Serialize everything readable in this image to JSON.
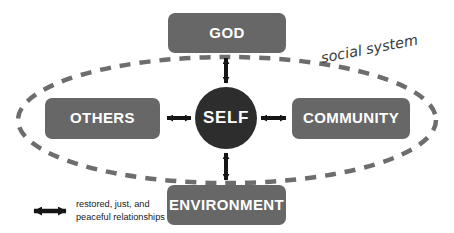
{
  "diagram": {
    "title_label": "social system",
    "center": {
      "id": "self",
      "label": "SELF",
      "shape": "circle",
      "fill": "#2d2d2d",
      "cx": 226,
      "cy": 118,
      "r": 31
    },
    "nodes": [
      {
        "id": "god",
        "label": "GOD",
        "shape": "rounded-rect",
        "fill": "#676767",
        "x": 168,
        "y": 13,
        "width": 118,
        "height": 40,
        "radius": 7
      },
      {
        "id": "others",
        "label": "OTHERS",
        "shape": "rounded-rect",
        "fill": "#676767",
        "x": 45,
        "y": 98,
        "width": 115,
        "height": 41,
        "radius": 7
      },
      {
        "id": "community",
        "label": "COMMUNITY",
        "shape": "rounded-rect",
        "fill": "#676767",
        "x": 292,
        "y": 98,
        "width": 118,
        "height": 41,
        "radius": 7
      },
      {
        "id": "environment",
        "label": "ENVIRONMENT",
        "shape": "rounded-rect",
        "fill": "#676767",
        "x": 167,
        "y": 185,
        "width": 119,
        "height": 40,
        "radius": 7
      }
    ],
    "connectors": [
      {
        "id": "self-god",
        "from": "self",
        "to": "god",
        "style": "double-arrow",
        "orientation": "vertical"
      },
      {
        "id": "self-others",
        "from": "self",
        "to": "others",
        "style": "double-arrow",
        "orientation": "horizontal"
      },
      {
        "id": "self-community",
        "from": "self",
        "to": "community",
        "style": "double-arrow",
        "orientation": "horizontal"
      },
      {
        "id": "self-environment",
        "from": "self",
        "to": "environment",
        "style": "double-arrow",
        "orientation": "vertical"
      }
    ],
    "boundary": {
      "id": "social-system-ellipse",
      "shape": "dashed-ellipse",
      "stroke": "#6d6d6d",
      "cx": 227,
      "cy": 120,
      "rx": 209,
      "ry": 63,
      "dash": "11 9",
      "stroke_width": 4.5
    },
    "legend": {
      "symbol": "double-arrow",
      "line_1": "restored, just, and",
      "line_2": "peaceful relationships"
    },
    "colors": {
      "box_fill": "#676767",
      "self_fill": "#2d2d2d",
      "arrow": "#151515",
      "ellipse": "#6d6d6d",
      "label_text": "#ffffff",
      "background": "#ffffff"
    }
  }
}
